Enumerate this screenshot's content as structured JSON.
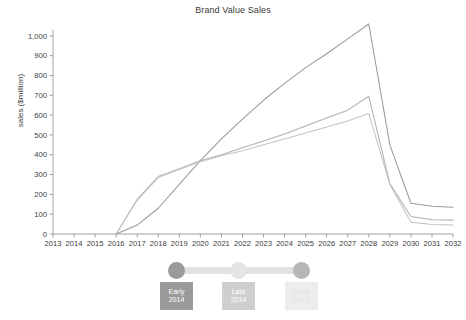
{
  "chart_data": {
    "type": "line",
    "title": "Brand Value Sales",
    "xlabel": "",
    "ylabel": "sales ($million)",
    "grid": false,
    "legend_position": "none",
    "x": [
      2013,
      2014,
      2015,
      2016,
      2017,
      2018,
      2019,
      2020,
      2021,
      2022,
      2023,
      2024,
      2025,
      2026,
      2027,
      2028,
      2029,
      2030,
      2031,
      2032
    ],
    "xlim": [
      2013,
      2032
    ],
    "ylim": [
      0,
      1060
    ],
    "ytick_labels": [
      "0",
      "100",
      "200",
      "300",
      "400",
      "500",
      "600",
      "700",
      "800",
      "900",
      "1,000"
    ],
    "yticks": [
      0,
      100,
      200,
      300,
      400,
      500,
      600,
      700,
      800,
      900,
      1000
    ],
    "xtick_labels": [
      "2013",
      "2014",
      "2015",
      "2016",
      "2017",
      "2018",
      "2019",
      "2020",
      "2021",
      "2022",
      "2023",
      "2024",
      "2025",
      "2026",
      "2027",
      "2028",
      "2029",
      "2030",
      "2031",
      "2032"
    ],
    "series": [
      {
        "name": "Early 2014",
        "color": "#9a9a9a",
        "values": [
          null,
          null,
          null,
          0,
          45,
          130,
          250,
          370,
          480,
          580,
          675,
          760,
          840,
          910,
          985,
          1060,
          450,
          155,
          140,
          135
        ]
      },
      {
        "name": "Late 2014",
        "color": "#b0b0b0",
        "values": [
          null,
          null,
          null,
          0,
          175,
          290,
          330,
          370,
          400,
          435,
          470,
          505,
          545,
          585,
          625,
          695,
          255,
          88,
          72,
          70
        ]
      },
      {
        "name": "Early 2015",
        "color": "#c4c4c4",
        "values": [
          null,
          null,
          null,
          0,
          170,
          285,
          325,
          365,
          395,
          420,
          450,
          480,
          510,
          540,
          570,
          608,
          250,
          60,
          48,
          45
        ]
      }
    ]
  },
  "slider": {
    "handles": [
      {
        "name": "handle-early-2014",
        "color": "#9a9a9a"
      },
      {
        "name": "handle-late-2014",
        "color": "#e4e4e4"
      },
      {
        "name": "handle-early-2015",
        "color": "#b7b7b7"
      }
    ],
    "chips": [
      {
        "line1": "Early",
        "line2": "2014"
      },
      {
        "line1": "Late",
        "line2": "2014"
      },
      {
        "line1": "Early",
        "line2": "2015"
      }
    ]
  }
}
